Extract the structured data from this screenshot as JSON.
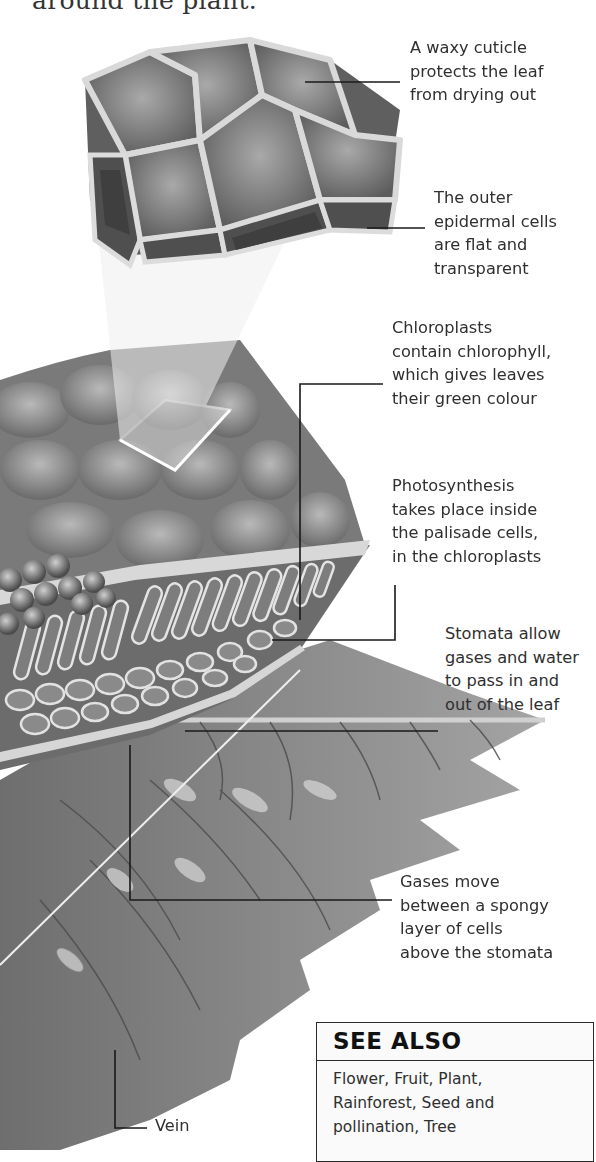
{
  "page": {
    "intro_text": "around the plant."
  },
  "labels": [
    {
      "id": "cuticle",
      "text": "A waxy cuticle\nprotects the leaf\nfrom drying out",
      "x": 410,
      "y": 36
    },
    {
      "id": "epidermis",
      "text": "The outer\nepidermal cells\nare flat and\ntransparent",
      "x": 434,
      "y": 186
    },
    {
      "id": "chloroplasts",
      "text": "Chloroplasts\ncontain chlorophyll,\nwhich gives leaves\ntheir green colour",
      "x": 392,
      "y": 316
    },
    {
      "id": "photosynthesis",
      "text": "Photosynthesis\ntakes place inside\nthe palisade cells,\nin the chloroplasts",
      "x": 392,
      "y": 474
    },
    {
      "id": "stomata",
      "text": "Stomata allow\ngases and water\nto pass in and\nout of the leaf",
      "x": 445,
      "y": 622
    },
    {
      "id": "spongy",
      "text": "Gases move\nbetween a spongy\nlayer of cells\nabove the stomata",
      "x": 400,
      "y": 870
    },
    {
      "id": "vein",
      "text": "Vein",
      "x": 155,
      "y": 1112
    }
  ],
  "see_also": {
    "title": "SEE ALSO",
    "body": "Flower, Fruit, Plant,\nRainforest, Seed and\npollination, Tree"
  },
  "colors": {
    "leaf_dark": "#5a5a5a",
    "leaf_mid": "#8a8a8a",
    "leaf_light": "#bdbdbd",
    "cell_wall": "#e6e6e6",
    "leader_line": "#1a1a1a"
  }
}
